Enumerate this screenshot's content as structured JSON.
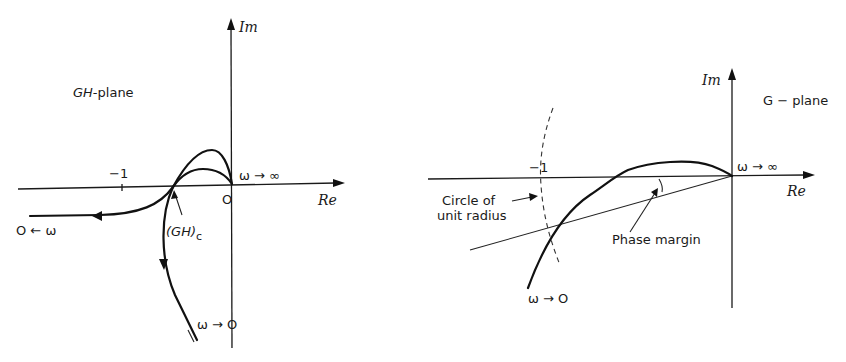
{
  "left_diagram": {
    "plane_label": "GH-plane",
    "axis_im": "Im",
    "axis_re": "Re",
    "tick_minus_one": "−1",
    "origin": "O",
    "omega_to_inf": "ω → ∞",
    "zero_from_omega": "O ← ω",
    "omega_to_zero": "ω → O",
    "critical_point": "(GH)",
    "critical_subscript": "c"
  },
  "right_diagram": {
    "plane_label": "G − plane",
    "axis_im": "Im",
    "axis_re": "Re",
    "tick_minus_one": "−1",
    "omega_to_inf": "ω → ∞",
    "omega_to_zero": "ω → O",
    "circle_label_line1": "Circle of",
    "circle_label_line2": "unit radius",
    "phase_margin_label": "Phase margin"
  }
}
